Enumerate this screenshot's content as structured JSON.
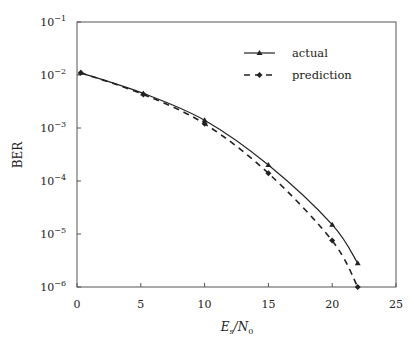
{
  "chart_data": {
    "type": "line",
    "title": "",
    "xlabel": "E_s/N_0",
    "ylabel": "BER",
    "xscale": "linear",
    "yscale": "log",
    "xlim": [
      0,
      25
    ],
    "ylim": [
      1e-06,
      0.1
    ],
    "xticks": [
      0,
      5,
      10,
      15,
      20,
      25
    ],
    "yticks": [
      {
        "base": "10",
        "exp": "−1",
        "value": 0.1
      },
      {
        "base": "10",
        "exp": "−2",
        "value": 0.01
      },
      {
        "base": "10",
        "exp": "−3",
        "value": 0.001
      },
      {
        "base": "10",
        "exp": "−4",
        "value": 0.0001
      },
      {
        "base": "10",
        "exp": "−5",
        "value": 1e-05
      },
      {
        "base": "10",
        "exp": "−6",
        "value": 1e-06
      }
    ],
    "grid": false,
    "legend_position": "upper right",
    "series": [
      {
        "name": "actual",
        "style": "solid",
        "marker": "triangle",
        "x": [
          0.3,
          5.2,
          10,
          15,
          20,
          22
        ],
        "y": [
          0.011,
          0.0045,
          0.0014,
          0.0002,
          1.5e-05,
          2.8e-06
        ]
      },
      {
        "name": "prediction",
        "style": "dashed",
        "marker": "diamond",
        "x": [
          0.3,
          5.2,
          10,
          15,
          20,
          22
        ],
        "y": [
          0.011,
          0.0043,
          0.0012,
          0.00014,
          7.5e-06,
          1e-06
        ]
      }
    ]
  },
  "labels": {
    "xlabel_main": "E",
    "xlabel_sub": "s",
    "xlabel_slash": "/N",
    "xlabel_sub2": "0",
    "ylabel": "BER",
    "legend_actual": "actual",
    "legend_prediction": "prediction"
  },
  "colors": {
    "axis": "#555555",
    "line": "#222222"
  }
}
